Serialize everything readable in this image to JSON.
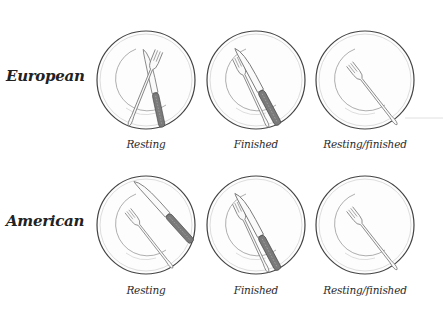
{
  "rows": [
    {
      "label": "European",
      "plates": [
        {
          "caption": "Resting",
          "cx": 146,
          "cy": 80
        },
        {
          "caption": "Finished",
          "cx": 256,
          "cy": 80
        },
        {
          "caption": "Resting/finished",
          "cx": 365,
          "cy": 80
        }
      ]
    },
    {
      "label": "American",
      "plates": [
        {
          "caption": "Resting",
          "cx": 146,
          "cy": 225
        },
        {
          "caption": "Finished",
          "cx": 256,
          "cy": 225
        },
        {
          "caption": "Resting/finished",
          "cx": 365,
          "cy": 225
        }
      ]
    }
  ],
  "colors": {
    "plate_rim": "#444444",
    "plate_inner": "#bbbbbb",
    "utensil_outline": "#777777",
    "knife_handle": "#6b6b6b",
    "background": "#ffffff"
  }
}
